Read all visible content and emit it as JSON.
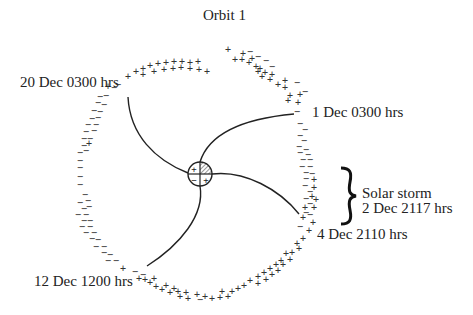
{
  "title": "Orbit 1",
  "labels": {
    "dec20": "20 Dec 0300 hrs",
    "dec1": "1 Dec 0300 hrs",
    "dec4": "4 Dec 2110 hrs",
    "dec12": "12 Dec 1200 hrs",
    "storm_line1": "Solar storm",
    "storm_line2": "2 Dec 2117 hrs"
  },
  "center_body": {
    "quadrants": [
      "+",
      "hatched",
      "−",
      "+"
    ]
  },
  "spiral_lines": [
    {
      "to": "20 Dec 0300 hrs"
    },
    {
      "to": "1 Dec 0300 hrs"
    },
    {
      "to": "4 Dec 2110 hrs"
    },
    {
      "to": "12 Dec 1200 hrs"
    }
  ],
  "legend_symbols": {
    "positive": "+",
    "negative": "−"
  },
  "colors": {
    "ink": "#222222",
    "background": "#ffffff"
  }
}
